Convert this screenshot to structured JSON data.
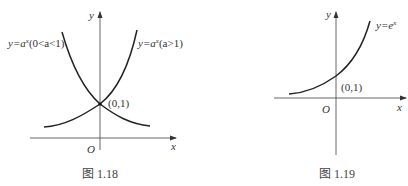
{
  "figures": [
    {
      "id": "fig-1-18",
      "caption": "图 1.18",
      "axis_x_label": "x",
      "axis_y_label": "y",
      "origin_label": "O",
      "point_label": "(0,1)",
      "curves": [
        {
          "label_prefix": "y=a",
          "label_exp": "x",
          "label_suffix": "(0<a<1)",
          "description": "decreasing exponential"
        },
        {
          "label_prefix": "y=a",
          "label_exp": "x",
          "label_suffix": "(a>1)",
          "description": "increasing exponential"
        }
      ]
    },
    {
      "id": "fig-1-19",
      "caption": "图 1.19",
      "axis_x_label": "x",
      "axis_y_label": "y",
      "origin_label": "O",
      "point_label": "(0,1)",
      "curves": [
        {
          "label_prefix": "y=e",
          "label_exp": "x",
          "label_suffix": "",
          "description": "natural exponential"
        }
      ]
    }
  ],
  "colors": {
    "curve": "#222222",
    "axis": "#555555",
    "text": "#333333"
  }
}
